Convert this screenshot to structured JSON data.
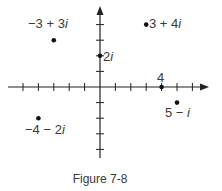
{
  "figure": {
    "caption": "Figure 7-8",
    "colors": {
      "ink": "#222222",
      "text": "#3a3a3a",
      "background": "#ffffff"
    }
  },
  "axes": {
    "origin_px": [
      100,
      87
    ],
    "unit_px": [
      15.4,
      15.6
    ],
    "x_range": [
      -6,
      7
    ],
    "y_range": [
      -4,
      5
    ],
    "x_ticks": [
      -5,
      -4,
      -3,
      -2,
      -1,
      1,
      2,
      3,
      4,
      5,
      6
    ],
    "y_ticks": [
      -4,
      -3,
      -2,
      -1,
      1,
      2,
      3,
      4
    ],
    "arrows": [
      "positive-x",
      "positive-y"
    ]
  },
  "points": [
    {
      "id": "p1",
      "label_parts": [
        "−3 + 3",
        "i"
      ],
      "re": -3,
      "im": 3
    },
    {
      "id": "p2",
      "label_parts": [
        "3 + 4",
        "i"
      ],
      "re": 3,
      "im": 4
    },
    {
      "id": "p3",
      "label_parts": [
        "2",
        "i"
      ],
      "re": 0,
      "im": 2
    },
    {
      "id": "p4",
      "label_parts": [
        "4",
        ""
      ],
      "re": 4,
      "im": 0
    },
    {
      "id": "p5",
      "label_parts": [
        "5 − ",
        "i"
      ],
      "re": 5,
      "im": -1
    },
    {
      "id": "p6",
      "label_parts": [
        "−4 − 2",
        "i"
      ],
      "re": -4,
      "im": -2
    }
  ]
}
